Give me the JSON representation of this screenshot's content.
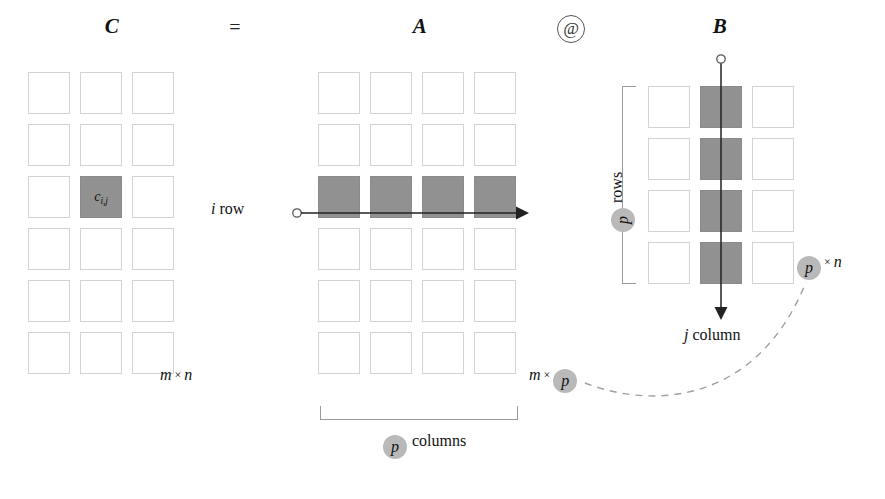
{
  "diagram": {
    "title_row": {
      "c_label": "C",
      "equals": "=",
      "a_label": "A",
      "at_operator": "@",
      "b_label": "B"
    },
    "matrix_c": {
      "name": "C",
      "rows": 6,
      "cols": 3,
      "highlight_cell": {
        "row": 3,
        "col": 2,
        "label": "c",
        "subscript": "i,j"
      },
      "dimension": {
        "first": "m",
        "times": "×",
        "second": "n"
      }
    },
    "matrix_a": {
      "name": "A",
      "rows": 6,
      "cols": 4,
      "highlight_row": 3,
      "row_arrow_label": "i row",
      "row_arrow_label_italic": "i",
      "row_arrow_label_roman": "row",
      "dimension": {
        "first": "m",
        "times": "×",
        "second": "p"
      },
      "bracket_label_pill": "p",
      "bracket_label_text": "columns"
    },
    "matrix_b": {
      "name": "B",
      "rows": 4,
      "cols": 3,
      "highlight_col": 2,
      "col_arrow_label_italic": "j",
      "col_arrow_label_roman": "column",
      "bracket_label_pill": "p",
      "bracket_label_text": "rows",
      "dimension": {
        "pill": "p",
        "times": "×",
        "second": "n"
      }
    },
    "colors": {
      "highlight_fill": "#919191",
      "cell_border": "#d2d2d2",
      "pill_fill": "#b9b9b9",
      "arrow": "#222222",
      "bracket": "#9a9a9a",
      "dashed_link": "#9a9a9a",
      "background": "#ffffff"
    }
  }
}
